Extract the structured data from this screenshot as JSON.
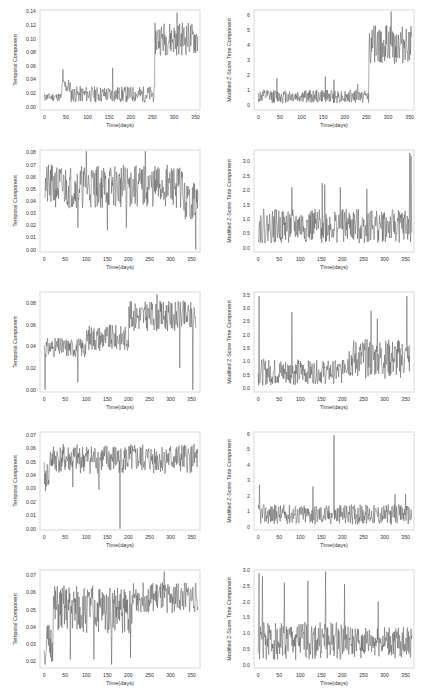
{
  "figure": {
    "line_color": "#555555",
    "frame_color": "#cfcfcf",
    "grid_color": "#eeeeee",
    "text_color": "#333333"
  },
  "chart_data": [
    {
      "id": "r1c1",
      "type": "line",
      "row": 0,
      "col": 0,
      "xlabel": "Time(days)",
      "ylabel": "Temporal Component",
      "xlim": [
        -10,
        360
      ],
      "ylim": [
        -0.005,
        0.142
      ],
      "xticks": [
        0,
        50,
        100,
        150,
        200,
        250,
        300,
        350
      ],
      "yticks": [
        0.0,
        0.02,
        0.04,
        0.06,
        0.08,
        0.1,
        0.12,
        0.14
      ],
      "ytick_labels": [
        "0.00",
        "0.02",
        "0.04",
        "0.06",
        "0.08",
        "0.10",
        "0.12",
        "0.14"
      ],
      "segments": [
        {
          "x0": 0,
          "x1": 40,
          "base": 0.014,
          "amp": 0.006
        },
        {
          "x0": 40,
          "x1": 60,
          "base": 0.03,
          "amp": 0.012,
          "spike": [
            43,
            0.055
          ]
        },
        {
          "x0": 60,
          "x1": 255,
          "base": 0.018,
          "amp": 0.012,
          "spike": [
            158,
            0.057
          ]
        },
        {
          "x0": 255,
          "x1": 355,
          "base": 0.1,
          "amp": 0.025,
          "spike": [
            307,
            0.138
          ]
        }
      ],
      "seed": 11
    },
    {
      "id": "r1c2",
      "type": "line",
      "row": 0,
      "col": 1,
      "xlabel": "Time(days)",
      "ylabel": "Modified Z-Score Time Component",
      "xlim": [
        -10,
        360
      ],
      "ylim": [
        -0.3,
        6.3
      ],
      "xticks": [
        0,
        50,
        100,
        150,
        200,
        250,
        300,
        350
      ],
      "yticks": [
        0,
        1,
        2,
        3,
        4,
        5,
        6
      ],
      "ytick_labels": [
        "0",
        "1",
        "2",
        "3",
        "4",
        "5",
        "6"
      ],
      "segments": [
        {
          "x0": 0,
          "x1": 255,
          "base": 0.6,
          "amp": 0.45,
          "spike": [
            43,
            1.8
          ]
        },
        {
          "x0": 255,
          "x1": 355,
          "base": 4.0,
          "amp": 1.3,
          "spike": [
            307,
            6.2
          ]
        }
      ],
      "spikes": [
        [
          155,
          1.9
        ],
        [
          175,
          1.7
        ],
        [
          230,
          1.4
        ]
      ],
      "seed": 12
    },
    {
      "id": "r2c1",
      "type": "line",
      "row": 1,
      "col": 0,
      "xlabel": "Time(days)",
      "ylabel": "Temporal Component",
      "xlim": [
        -10,
        370
      ],
      "ylim": [
        -0.002,
        0.082
      ],
      "xticks": [
        0,
        50,
        100,
        150,
        200,
        250,
        300,
        350
      ],
      "yticks": [
        0.0,
        0.01,
        0.02,
        0.03,
        0.04,
        0.05,
        0.06,
        0.07,
        0.08
      ],
      "ytick_labels": [
        "0.00",
        "0.01",
        "0.02",
        "0.03",
        "0.04",
        "0.05",
        "0.06",
        "0.07",
        "0.08"
      ],
      "segments": [
        {
          "x0": 0,
          "x1": 330,
          "base": 0.052,
          "amp": 0.018
        },
        {
          "x0": 330,
          "x1": 365,
          "base": 0.04,
          "amp": 0.016,
          "spike": [
            360,
            0.0
          ]
        }
      ],
      "spikes": [
        [
          80,
          0.018
        ],
        [
          150,
          0.016
        ],
        [
          195,
          0.018
        ],
        [
          100,
          0.081
        ],
        [
          240,
          0.081
        ]
      ],
      "seed": 21
    },
    {
      "id": "r2c2",
      "type": "line",
      "row": 1,
      "col": 1,
      "xlabel": "Time(days)",
      "ylabel": "Modified Z-Score Time Component",
      "xlim": [
        -10,
        370
      ],
      "ylim": [
        -0.15,
        3.4
      ],
      "xticks": [
        0,
        50,
        100,
        150,
        200,
        250,
        300,
        350
      ],
      "yticks": [
        0.0,
        0.5,
        1.0,
        1.5,
        2.0,
        2.5,
        3.0
      ],
      "ytick_labels": [
        "0.0",
        "0.5",
        "1.0",
        "1.5",
        "2.0",
        "2.5",
        "3.0"
      ],
      "segments": [
        {
          "x0": 0,
          "x1": 365,
          "base": 0.75,
          "amp": 0.6
        }
      ],
      "spikes": [
        [
          80,
          2.1
        ],
        [
          152,
          2.25
        ],
        [
          158,
          2.2
        ],
        [
          195,
          2.1
        ],
        [
          258,
          2.05
        ],
        [
          360,
          3.3
        ],
        [
          363,
          3.2
        ]
      ],
      "seed": 22
    },
    {
      "id": "r3c1",
      "type": "line",
      "row": 2,
      "col": 0,
      "xlabel": "Time(days)",
      "ylabel": "Temporal Component",
      "xlim": [
        -10,
        370
      ],
      "ylim": [
        -0.002,
        0.09
      ],
      "xticks": [
        0,
        50,
        100,
        150,
        200,
        250,
        300,
        350
      ],
      "yticks": [
        0.0,
        0.02,
        0.04,
        0.06,
        0.08
      ],
      "ytick_labels": [
        "0.00",
        "0.02",
        "0.04",
        "0.06",
        "0.08"
      ],
      "segments": [
        {
          "x0": 0,
          "x1": 100,
          "base": 0.039,
          "amp": 0.009,
          "spike": [
            80,
            0.007
          ]
        },
        {
          "x0": 100,
          "x1": 200,
          "base": 0.048,
          "amp": 0.012
        },
        {
          "x0": 200,
          "x1": 360,
          "base": 0.068,
          "amp": 0.014,
          "spike": [
            268,
            0.088
          ]
        }
      ],
      "spikes": [
        [
          2,
          0.0
        ],
        [
          322,
          0.02
        ],
        [
          353,
          0.0
        ],
        [
          362,
          0.0
        ]
      ],
      "seed": 31
    },
    {
      "id": "r3c2",
      "type": "line",
      "row": 2,
      "col": 1,
      "xlabel": "Time(days)",
      "ylabel": "Modified Z-Score Time Component",
      "xlim": [
        -10,
        370
      ],
      "ylim": [
        -0.15,
        3.6
      ],
      "xticks": [
        0,
        50,
        100,
        150,
        200,
        250,
        300,
        350
      ],
      "yticks": [
        0.0,
        0.5,
        1.0,
        1.5,
        2.0,
        2.5,
        3.0,
        3.5
      ],
      "ytick_labels": [
        "0.0",
        "0.5",
        "1.0",
        "1.5",
        "2.0",
        "2.5",
        "3.0",
        "3.5"
      ],
      "segments": [
        {
          "x0": 0,
          "x1": 100,
          "base": 0.6,
          "amp": 0.5
        },
        {
          "x0": 100,
          "x1": 200,
          "base": 0.6,
          "amp": 0.45
        },
        {
          "x0": 200,
          "x1": 360,
          "base": 1.1,
          "amp": 0.75
        }
      ],
      "spikes": [
        [
          2,
          3.45
        ],
        [
          80,
          2.85
        ],
        [
          268,
          2.9
        ],
        [
          283,
          2.6
        ],
        [
          353,
          3.45
        ],
        [
          362,
          3.4
        ]
      ],
      "seed": 32
    },
    {
      "id": "r4c1",
      "type": "line",
      "row": 3,
      "col": 0,
      "xlabel": "Time(days)",
      "ylabel": "Temporal Component",
      "xlim": [
        -10,
        370
      ],
      "ylim": [
        -0.001,
        0.072
      ],
      "xticks": [
        0,
        50,
        100,
        150,
        200,
        250,
        300,
        350
      ],
      "yticks": [
        0.0,
        0.01,
        0.02,
        0.03,
        0.04,
        0.05,
        0.06,
        0.07
      ],
      "ytick_labels": [
        "0.00",
        "0.01",
        "0.02",
        "0.03",
        "0.04",
        "0.05",
        "0.06",
        "0.07"
      ],
      "segments": [
        {
          "x0": 0,
          "x1": 12,
          "base": 0.04,
          "amp": 0.01,
          "spike": [
            3,
            0.028
          ]
        },
        {
          "x0": 12,
          "x1": 365,
          "base": 0.052,
          "amp": 0.011
        }
      ],
      "spikes": [
        [
          180,
          0.0
        ],
        [
          130,
          0.029
        ],
        [
          68,
          0.031
        ]
      ],
      "seed": 41
    },
    {
      "id": "r4c2",
      "type": "line",
      "row": 3,
      "col": 1,
      "xlabel": "Time(days)",
      "ylabel": "Modified Z-Score Time Component",
      "xlim": [
        -10,
        370
      ],
      "ylim": [
        -0.2,
        6.1
      ],
      "xticks": [
        0,
        50,
        100,
        150,
        200,
        250,
        300,
        350
      ],
      "yticks": [
        0,
        1,
        2,
        3,
        4,
        5,
        6
      ],
      "ytick_labels": [
        "0",
        "1",
        "2",
        "3",
        "4",
        "5",
        "6"
      ],
      "segments": [
        {
          "x0": 0,
          "x1": 365,
          "base": 0.8,
          "amp": 0.65
        }
      ],
      "spikes": [
        [
          3,
          2.7
        ],
        [
          130,
          2.6
        ],
        [
          180,
          5.9
        ],
        [
          325,
          2.1
        ],
        [
          350,
          2.1
        ]
      ],
      "seed": 42
    },
    {
      "id": "r5c1",
      "type": "line",
      "row": 4,
      "col": 0,
      "xlabel": "Time(days)",
      "ylabel": "Temporal Component",
      "xlim": [
        -10,
        370
      ],
      "ylim": [
        0.016,
        0.073
      ],
      "xticks": [
        0,
        50,
        100,
        150,
        200,
        250,
        300,
        350
      ],
      "yticks": [
        0.02,
        0.03,
        0.04,
        0.05,
        0.06,
        0.07
      ],
      "ytick_labels": [
        "0.02",
        "0.03",
        "0.04",
        "0.05",
        "0.06",
        "0.07"
      ],
      "segments": [
        {
          "x0": 0,
          "x1": 20,
          "base": 0.03,
          "amp": 0.012,
          "spike": [
            2,
            0.018
          ]
        },
        {
          "x0": 20,
          "x1": 210,
          "base": 0.05,
          "amp": 0.014
        },
        {
          "x0": 210,
          "x1": 365,
          "base": 0.057,
          "amp": 0.009
        }
      ],
      "spikes": [
        [
          62,
          0.021
        ],
        [
          118,
          0.021
        ],
        [
          160,
          0.018
        ],
        [
          205,
          0.022
        ],
        [
          285,
          0.072
        ]
      ],
      "seed": 51
    },
    {
      "id": "r5c2",
      "type": "line",
      "row": 4,
      "col": 1,
      "xlabel": "Time(days)",
      "ylabel": "Modified Z-Score Time Component",
      "xlim": [
        -10,
        370
      ],
      "ylim": [
        -0.1,
        3.0
      ],
      "xticks": [
        0,
        50,
        100,
        150,
        200,
        250,
        300,
        350
      ],
      "yticks": [
        0.0,
        0.5,
        1.0,
        1.5,
        2.0,
        2.5,
        3.0
      ],
      "ytick_labels": [
        "0.0",
        "0.5",
        "1.0",
        "1.5",
        "2.0",
        "2.5",
        "3.0"
      ],
      "segments": [
        {
          "x0": 0,
          "x1": 210,
          "base": 0.75,
          "amp": 0.6
        },
        {
          "x0": 210,
          "x1": 365,
          "base": 0.7,
          "amp": 0.5
        }
      ],
      "spikes": [
        [
          2,
          2.9
        ],
        [
          10,
          2.8
        ],
        [
          62,
          2.6
        ],
        [
          118,
          2.65
        ],
        [
          160,
          2.95
        ],
        [
          205,
          2.55
        ],
        [
          285,
          2.0
        ]
      ],
      "seed": 52
    }
  ],
  "layout": {
    "panels": [
      {
        "x": 0,
        "y": 0,
        "w": 214,
        "h": 140
      },
      {
        "x": 214,
        "y": 0,
        "w": 214,
        "h": 140
      }
    ]
  }
}
